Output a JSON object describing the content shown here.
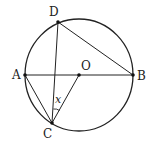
{
  "figure": {
    "type": "circle-geometry",
    "circle": {
      "center": "O",
      "cx": 79,
      "cy": 75,
      "rx": 54,
      "ry": 56
    },
    "points": {
      "A": {
        "label": "A",
        "x": 25,
        "y": 75
      },
      "B": {
        "label": "B",
        "x": 133,
        "y": 75
      },
      "O": {
        "label": "O",
        "x": 79,
        "y": 75
      },
      "D": {
        "label": "D",
        "x": 58,
        "y": 22
      },
      "C": {
        "label": "C",
        "x": 52,
        "y": 123
      }
    },
    "segments": [
      "AB",
      "DB",
      "DC",
      "AC",
      "CO"
    ],
    "angle_label": "x",
    "angle_vertex": "C",
    "angle_between": [
      "CD",
      "CO"
    ],
    "colors": {
      "stroke": "#222222",
      "background": "#ffffff"
    }
  }
}
